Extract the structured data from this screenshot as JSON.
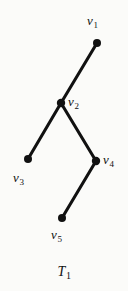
{
  "figure": {
    "caption_symbol": "T",
    "caption_subscript": "1",
    "background_color": "#fbfbf9",
    "ink_color": "#111111"
  },
  "graph": {
    "vertices": [
      {
        "id": "v1",
        "symbol": "v",
        "subscript": "1",
        "x": 97,
        "y": 43,
        "label_x": 87,
        "label_y": 14,
        "radius": 4.0
      },
      {
        "id": "v2",
        "symbol": "v",
        "subscript": "2",
        "x": 61,
        "y": 103,
        "label_x": 68,
        "label_y": 95,
        "radius": 4.2
      },
      {
        "id": "v3",
        "symbol": "v",
        "subscript": "3",
        "x": 28,
        "y": 159,
        "label_x": 13,
        "label_y": 171,
        "radius": 4.0
      },
      {
        "id": "v4",
        "symbol": "v",
        "subscript": "4",
        "x": 96,
        "y": 161,
        "label_x": 103,
        "label_y": 153,
        "radius": 4.2
      },
      {
        "id": "v5",
        "symbol": "v",
        "subscript": "5",
        "x": 62,
        "y": 218,
        "label_x": 51,
        "label_y": 228,
        "radius": 4.0
      }
    ],
    "edges": [
      {
        "from": "v1",
        "to": "v2",
        "x1": 97,
        "y1": 43,
        "x2": 61,
        "y2": 103
      },
      {
        "from": "v2",
        "to": "v3",
        "x1": 61,
        "y1": 103,
        "x2": 28,
        "y2": 159
      },
      {
        "from": "v2",
        "to": "v4",
        "x1": 61,
        "y1": 103,
        "x2": 96,
        "y2": 161
      },
      {
        "from": "v4",
        "to": "v5",
        "x1": 96,
        "y1": 161,
        "x2": 62,
        "y2": 218
      }
    ],
    "edge_width": 3.1
  }
}
